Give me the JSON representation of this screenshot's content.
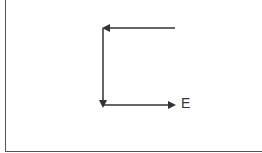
{
  "diagram": {
    "type": "arrow-path",
    "stroke_color": "#333333",
    "frame_color": "#555555",
    "arrows": [
      {
        "id": "top-arrow",
        "from": [
          175,
          28
        ],
        "to": [
          103,
          28
        ],
        "direction": "left"
      },
      {
        "id": "vertical-arrow",
        "from": [
          103,
          28
        ],
        "to": [
          103,
          108
        ],
        "direction": "down"
      },
      {
        "id": "bottom-arrow",
        "from": [
          103,
          105
        ],
        "to": [
          176,
          105
        ],
        "direction": "right"
      }
    ],
    "labels": [
      {
        "id": "end-label",
        "text": "E",
        "x": 181,
        "y": 96
      }
    ]
  }
}
